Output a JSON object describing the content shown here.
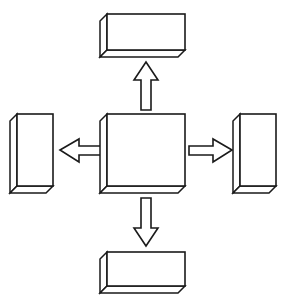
{
  "diagram": {
    "type": "block-diagram",
    "style": "isometric-3d-outline",
    "background_color": "#ffffff",
    "line_color": "#1a1a1a",
    "fill_color": "#ffffff",
    "canvas": {
      "width": 292,
      "height": 300
    },
    "node_count": 5,
    "arrow_count": 4,
    "nodes": [
      {
        "id": "center",
        "name": "center-node",
        "label": "",
        "shape": "3d-box",
        "orientation": "square",
        "position": "center",
        "face": {
          "x": 107,
          "y": 114,
          "width": 78,
          "height": 72
        },
        "depth": 7
      },
      {
        "id": "top",
        "name": "top-node",
        "label": "",
        "shape": "3d-box",
        "orientation": "horizontal",
        "position": "top",
        "face": {
          "x": 107,
          "y": 14,
          "width": 78,
          "height": 36
        },
        "depth": 7
      },
      {
        "id": "bottom",
        "name": "bottom-node",
        "label": "",
        "shape": "3d-box",
        "orientation": "horizontal",
        "position": "bottom",
        "face": {
          "x": 107,
          "y": 252,
          "width": 78,
          "height": 34
        },
        "depth": 7
      },
      {
        "id": "left",
        "name": "left-node",
        "label": "",
        "shape": "3d-box",
        "orientation": "vertical",
        "position": "left",
        "face": {
          "x": 17,
          "y": 114,
          "width": 36,
          "height": 72
        },
        "depth": 7
      },
      {
        "id": "right",
        "name": "right-node",
        "label": "",
        "shape": "3d-box",
        "orientation": "vertical",
        "position": "right",
        "face": {
          "x": 240,
          "y": 114,
          "width": 36,
          "height": 72
        },
        "depth": 7
      }
    ],
    "arrows": [
      {
        "id": "arrow-up",
        "name": "arrow-up",
        "label": "",
        "direction": "up",
        "from": "center",
        "to": "top",
        "style": "hollow-block-arrow"
      },
      {
        "id": "arrow-down",
        "name": "arrow-down",
        "label": "",
        "direction": "down",
        "from": "center",
        "to": "bottom",
        "style": "hollow-block-arrow"
      },
      {
        "id": "arrow-left",
        "name": "arrow-left",
        "label": "",
        "direction": "left",
        "from": "center",
        "to": "left",
        "style": "hollow-block-arrow"
      },
      {
        "id": "arrow-right",
        "name": "arrow-right",
        "label": "",
        "direction": "right",
        "from": "center",
        "to": "right",
        "style": "hollow-block-arrow"
      }
    ]
  }
}
